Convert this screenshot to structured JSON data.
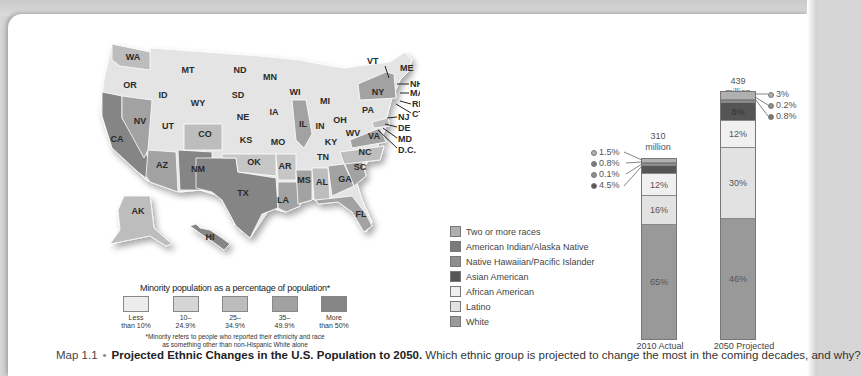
{
  "map": {
    "title": "US states minority population map",
    "states": [
      {
        "abbr": "WA",
        "x": 133,
        "y": 60,
        "bin": 2
      },
      {
        "abbr": "OR",
        "x": 130,
        "y": 88,
        "bin": 1
      },
      {
        "abbr": "MT",
        "x": 188,
        "y": 73,
        "bin": 1
      },
      {
        "abbr": "ID",
        "x": 163,
        "y": 98,
        "bin": 1
      },
      {
        "abbr": "WY",
        "x": 198,
        "y": 106,
        "bin": 1
      },
      {
        "abbr": "ND",
        "x": 240,
        "y": 73,
        "bin": 1
      },
      {
        "abbr": "SD",
        "x": 238,
        "y": 98,
        "bin": 1
      },
      {
        "abbr": "MN",
        "x": 270,
        "y": 80,
        "bin": 1
      },
      {
        "abbr": "WI",
        "x": 295,
        "y": 95,
        "bin": 1
      },
      {
        "abbr": "MI",
        "x": 325,
        "y": 104,
        "bin": 1
      },
      {
        "abbr": "NE",
        "x": 243,
        "y": 120,
        "bin": 1
      },
      {
        "abbr": "IA",
        "x": 274,
        "y": 115,
        "bin": 1
      },
      {
        "abbr": "IL",
        "x": 303,
        "y": 127,
        "bin": 4
      },
      {
        "abbr": "IN",
        "x": 320,
        "y": 129,
        "bin": 1
      },
      {
        "abbr": "OH",
        "x": 340,
        "y": 123,
        "bin": 1
      },
      {
        "abbr": "PA",
        "x": 368,
        "y": 113,
        "bin": 1
      },
      {
        "abbr": "NY",
        "x": 378,
        "y": 95,
        "bin": 4
      },
      {
        "abbr": "NV",
        "x": 140,
        "y": 124,
        "bin": 4
      },
      {
        "abbr": "UT",
        "x": 168,
        "y": 129,
        "bin": 1
      },
      {
        "abbr": "CO",
        "x": 205,
        "y": 137,
        "bin": 3
      },
      {
        "abbr": "KS",
        "x": 246,
        "y": 143,
        "bin": 1
      },
      {
        "abbr": "MO",
        "x": 278,
        "y": 145,
        "bin": 1
      },
      {
        "abbr": "KY",
        "x": 331,
        "y": 145,
        "bin": 1
      },
      {
        "abbr": "WV",
        "x": 353,
        "y": 136,
        "bin": 1
      },
      {
        "abbr": "VA",
        "x": 374,
        "y": 139,
        "bin": 4
      },
      {
        "abbr": "CA",
        "x": 117,
        "y": 142,
        "bin": 5
      },
      {
        "abbr": "AZ",
        "x": 162,
        "y": 168,
        "bin": 4
      },
      {
        "abbr": "NM",
        "x": 198,
        "y": 172,
        "bin": 5
      },
      {
        "abbr": "OK",
        "x": 254,
        "y": 165,
        "bin": 3
      },
      {
        "abbr": "AR",
        "x": 285,
        "y": 169,
        "bin": 3
      },
      {
        "abbr": "TN",
        "x": 323,
        "y": 160,
        "bin": 1
      },
      {
        "abbr": "NC",
        "x": 365,
        "y": 155,
        "bin": 3
      },
      {
        "abbr": "SC",
        "x": 360,
        "y": 170,
        "bin": 4
      },
      {
        "abbr": "MS",
        "x": 304,
        "y": 183,
        "bin": 4
      },
      {
        "abbr": "AL",
        "x": 322,
        "y": 185,
        "bin": 3
      },
      {
        "abbr": "GA",
        "x": 345,
        "y": 182,
        "bin": 4
      },
      {
        "abbr": "TX",
        "x": 243,
        "y": 196,
        "bin": 5
      },
      {
        "abbr": "LA",
        "x": 283,
        "y": 203,
        "bin": 4
      },
      {
        "abbr": "FL",
        "x": 361,
        "y": 217,
        "bin": 4
      },
      {
        "abbr": "AK",
        "x": 138,
        "y": 214,
        "bin": 3
      },
      {
        "abbr": "HI",
        "x": 210,
        "y": 240,
        "bin": 5
      }
    ],
    "northeast_callouts": [
      "VT",
      "ME",
      "NH",
      "MA",
      "RI",
      "CT",
      "NJ",
      "DE",
      "MD",
      "D.C."
    ],
    "legend": {
      "title": "Minority population as a percentage of population*",
      "bins": [
        {
          "label_line1": "Less",
          "label_line2": "than 10%",
          "color": "#ececec"
        },
        {
          "label_line1": "10–",
          "label_line2": "24.9%",
          "color": "#d5d5d5"
        },
        {
          "label_line1": "25–",
          "label_line2": "34.9%",
          "color": "#bdbdbd"
        },
        {
          "label_line1": "35–",
          "label_line2": "49.9%",
          "color": "#a2a2a2"
        },
        {
          "label_line1": "More",
          "label_line2": "than 50%",
          "color": "#858585"
        }
      ],
      "note_line1": "*Minority refers to people who reported their ethnicity and race",
      "note_line2": "as something other than non-Hispanic White alone"
    }
  },
  "race_legend": [
    {
      "label": "Two or more races",
      "color": "#b0b0b0"
    },
    {
      "label": "American Indian/Alaska Native",
      "color": "#7a7a7a"
    },
    {
      "label": "Native Hawaiian/Pacific Islander",
      "color": "#8e8e8e"
    },
    {
      "label": "Asian American",
      "color": "#555555"
    },
    {
      "label": "African American",
      "color": "#e8e8e8"
    },
    {
      "label": "Latino",
      "color": "#dcdcdc"
    },
    {
      "label": "White",
      "color": "#999999"
    }
  ],
  "chart_data": {
    "type": "bar",
    "subtype": "stacked-100",
    "title": "Projected Ethnic Changes in the U.S. Population to 2050",
    "categories": [
      "2010 Actual",
      "2050 Projected"
    ],
    "totals": [
      "310 million",
      "439 million"
    ],
    "series": [
      {
        "name": "White",
        "values": [
          65,
          46
        ]
      },
      {
        "name": "Latino",
        "values": [
          16,
          30
        ]
      },
      {
        "name": "African American",
        "values": [
          12,
          12
        ]
      },
      {
        "name": "Asian American",
        "values": [
          4.5,
          8
        ]
      },
      {
        "name": "Native Hawaiian/Pacific Islander",
        "values": [
          0.1,
          0.2
        ]
      },
      {
        "name": "American Indian/Alaska Native",
        "values": [
          0.8,
          0.8
        ]
      },
      {
        "name": "Two or more races",
        "values": [
          1.5,
          3
        ]
      }
    ],
    "xlabel": "",
    "ylabel": "Percent of population",
    "ylim": [
      0,
      100
    ],
    "legend_position": "left",
    "grid": false
  },
  "bars": {
    "b2010": {
      "total_line1": "310",
      "total_line2": "million",
      "category": "2010 Actual",
      "labels": {
        "white": "65%",
        "latino": "16%",
        "african": "12%"
      },
      "callouts": [
        "1.5%",
        "0.8%",
        "0.1%",
        "4.5%"
      ]
    },
    "b2050": {
      "total_line1": "439",
      "total_line2": "million",
      "category": "2050 Projected",
      "labels": {
        "white": "46%",
        "latino": "30%",
        "african": "12%",
        "asian": "8%"
      },
      "callouts": [
        "3%",
        "0.2%",
        "0.8%"
      ]
    }
  },
  "caption": {
    "number": "Map 1.1",
    "bullet": "•",
    "title": "Projected Ethnic Changes in the U.S. Population to 2050.",
    "question": "Which ethnic group is projected to change the most in the coming decades, and why?"
  }
}
